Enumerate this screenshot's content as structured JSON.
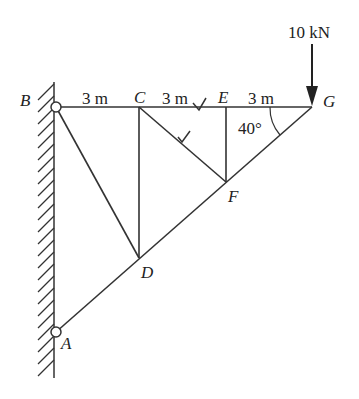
{
  "diagram": {
    "type": "truss",
    "load": {
      "label": "10 kN",
      "node": "G",
      "direction": "down"
    },
    "nodes": {
      "A": "A",
      "B": "B",
      "C": "C",
      "D": "D",
      "E": "E",
      "F": "F",
      "G": "G"
    },
    "dimensions": [
      "3 m",
      "3 m",
      "3 m"
    ],
    "angle": "40°",
    "members": [
      "BC",
      "CE",
      "EG",
      "BD",
      "CD",
      "CF",
      "EF",
      "AD",
      "DF",
      "FG"
    ],
    "supports": [
      "A pin (wall)",
      "B pin (wall)"
    ],
    "marks": [
      "check on CE",
      "check on CF"
    ]
  }
}
